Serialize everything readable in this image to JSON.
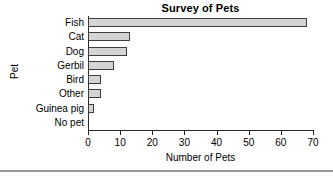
{
  "chart_data": {
    "type": "bar",
    "orientation": "horizontal",
    "title": "Survey of Pets",
    "xlabel": "Number of Pets",
    "ylabel": "Pet",
    "categories": [
      "Fish",
      "Cat",
      "Dog",
      "Gerbil",
      "Bird",
      "Other",
      "Guinea pig",
      "No pet"
    ],
    "values": [
      68,
      13,
      12,
      8,
      4,
      4,
      2,
      0
    ],
    "xlim": [
      0,
      70
    ],
    "xticks": [
      0,
      10,
      20,
      30,
      40,
      50,
      60,
      70
    ],
    "xtick_labels": [
      "0",
      "10",
      "20",
      "30",
      "40",
      "50",
      "60",
      "70"
    ],
    "grid": false,
    "legend": null,
    "bar_fill_color": "#d4d4d4",
    "bar_edge_color": "#3d3d3d",
    "axis_color": "#2a2a2a",
    "background_color": "#ffffff"
  },
  "footer": {
    "divider_color": "#9a9a9a"
  }
}
